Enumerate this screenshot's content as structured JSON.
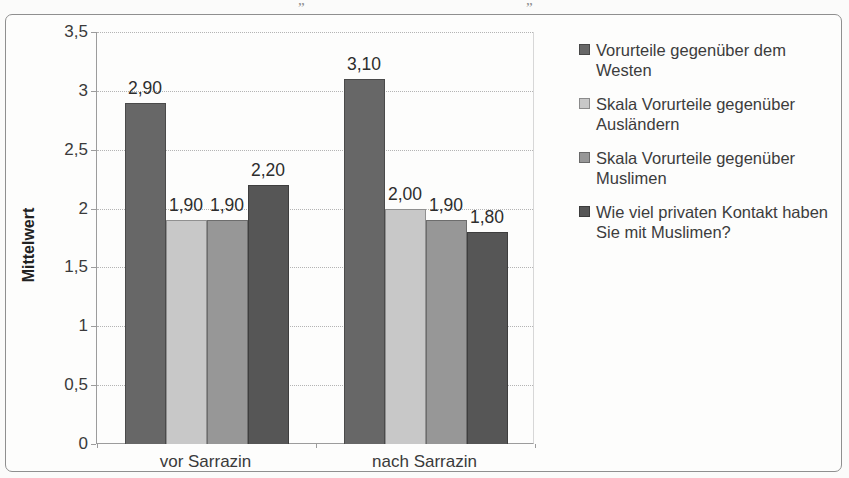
{
  "page": {
    "cropped_top_marks": [
      "„",
      "„"
    ]
  },
  "chart_data": {
    "type": "bar",
    "title": "",
    "categories": [
      "vor Sarrazin",
      "nach Sarrazin"
    ],
    "series": [
      {
        "name": "Vorurteile gegenüber dem Westen",
        "color": "#676767",
        "values": [
          2.9,
          3.1
        ],
        "value_labels": [
          "2,90",
          "3,10"
        ]
      },
      {
        "name": "Skala Vorurteile gegenüber Ausländern",
        "color": "#c8c8c8",
        "values": [
          1.9,
          2.0
        ],
        "value_labels": [
          "1,90",
          "2,00"
        ]
      },
      {
        "name": "Skala Vorurteile gegenüber Muslimen",
        "color": "#979797",
        "values": [
          1.9,
          1.9
        ],
        "value_labels": [
          "1,90",
          "1,90"
        ]
      },
      {
        "name": "Wie viel privaten Kontakt haben Sie mit Muslimen?",
        "color": "#565656",
        "values": [
          2.2,
          1.8
        ],
        "value_labels": [
          "2,20",
          "1,80"
        ]
      }
    ],
    "xlabel": "",
    "ylabel": "Mittelwert",
    "ylim": [
      0,
      3.5
    ],
    "yticks": [
      0,
      0.5,
      1,
      1.5,
      2,
      2.5,
      3,
      3.5
    ],
    "ytick_labels": [
      "0",
      "0,5",
      "1",
      "1,5",
      "2",
      "2,5",
      "3",
      "3,5"
    ],
    "decimal_separator": ",",
    "grid": true,
    "legend_position": "right"
  }
}
